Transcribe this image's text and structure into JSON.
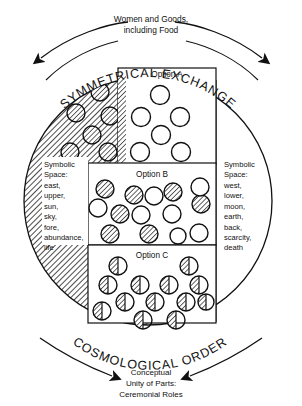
{
  "figure": {
    "title_top_flow": "Women and Goods,",
    "title_top_flow2": "including Food",
    "arc_top_label": "SYMMETRICAL EXCHANGE",
    "arc_bottom_label": "COSMOLOGICAL ORDER",
    "bottom_caption_line1": "Conceptual",
    "bottom_caption_line2": "Unity of Parts:",
    "bottom_caption_line3": "Ceremonial Roles",
    "left_moiety": {
      "heading1": "Symbolic",
      "heading2": "Space:",
      "terms": [
        "east,",
        "upper,",
        "sun,",
        "sky,",
        "fore,",
        "abundance,",
        "life"
      ]
    },
    "right_moiety": {
      "heading1": "Symbolic",
      "heading2": "Space:",
      "terms": [
        "west,",
        "lower,",
        "moon,",
        "earth,",
        "back,",
        "scarcity,",
        "death"
      ]
    },
    "options": [
      {
        "label": "Option A",
        "description": "Two contiguous blocks: hatched half with hatched circles, plain half with plain circles",
        "hatched_circles": 6,
        "plain_circles": 6
      },
      {
        "label": "Option B",
        "description": "Intermixed hatched and plain circles on plain field",
        "hatched_circles": 7,
        "plain_circles": 7
      },
      {
        "label": "Option C",
        "description": "Circles each split half hatched half plain",
        "split_circles": 13
      }
    ],
    "colors": {
      "ink": "#111111",
      "paper": "#ffffff",
      "hatch": "#111111"
    }
  }
}
